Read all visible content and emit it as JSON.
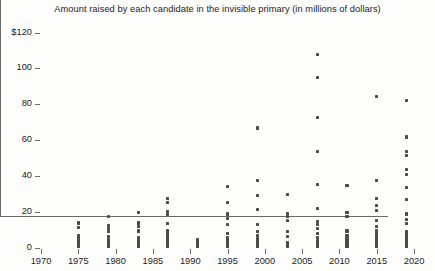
{
  "chart_data": {
    "type": "scatter",
    "title": "Amount raised by each candidate in the invisible primary (in millions of dollars)",
    "xlabel": "",
    "ylabel": "",
    "xlim": [
      1970,
      2022
    ],
    "ylim": [
      0,
      120
    ],
    "grid": false,
    "legend": null,
    "xticks": [
      1970,
      1975,
      1980,
      1985,
      1990,
      1995,
      2000,
      2005,
      2010,
      2015,
      2020
    ],
    "xtick_labels": [
      "1970",
      "1975",
      "1980",
      "1985",
      "1990",
      "1995",
      "2000",
      "2005",
      "2010",
      "2015",
      "2020"
    ],
    "yticks": [
      0,
      20,
      40,
      60,
      80,
      100,
      120
    ],
    "ytick_labels": [
      "0",
      "20",
      "40",
      "60",
      "80",
      "100",
      "$120"
    ],
    "marker": "square",
    "marker_color": "#4a4a4a",
    "series": [
      {
        "name": "candidates",
        "points": [
          [
            1975,
            1.0
          ],
          [
            1975,
            1.8
          ],
          [
            1975,
            2.6
          ],
          [
            1975,
            3.4
          ],
          [
            1975,
            4.2
          ],
          [
            1975,
            5.0
          ],
          [
            1975,
            6.0
          ],
          [
            1975,
            7.0
          ],
          [
            1975,
            11.5
          ],
          [
            1975,
            14.0
          ],
          [
            1979,
            0.8
          ],
          [
            1979,
            1.6
          ],
          [
            1979,
            2.4
          ],
          [
            1979,
            3.2
          ],
          [
            1979,
            4.0
          ],
          [
            1979,
            5.0
          ],
          [
            1979,
            6.2
          ],
          [
            1979,
            9.0
          ],
          [
            1979,
            11.0
          ],
          [
            1979,
            12.5
          ],
          [
            1979,
            17.5
          ],
          [
            1983,
            0.8
          ],
          [
            1983,
            1.6
          ],
          [
            1983,
            2.5
          ],
          [
            1983,
            3.5
          ],
          [
            1983,
            4.5
          ],
          [
            1983,
            6.0
          ],
          [
            1983,
            9.5
          ],
          [
            1983,
            12.0
          ],
          [
            1983,
            14.0
          ],
          [
            1983,
            20.0
          ],
          [
            1987,
            0.8
          ],
          [
            1987,
            1.6
          ],
          [
            1987,
            2.4
          ],
          [
            1987,
            3.2
          ],
          [
            1987,
            4.0
          ],
          [
            1987,
            5.0
          ],
          [
            1987,
            6.0
          ],
          [
            1987,
            7.0
          ],
          [
            1987,
            8.0
          ],
          [
            1987,
            9.0
          ],
          [
            1987,
            10.0
          ],
          [
            1987,
            13.5
          ],
          [
            1987,
            18.5
          ],
          [
            1987,
            20.5
          ],
          [
            1987,
            25.5
          ],
          [
            1987,
            27.5
          ],
          [
            1991,
            0.7
          ],
          [
            1991,
            1.4
          ],
          [
            1991,
            2.1
          ],
          [
            1991,
            3.0
          ],
          [
            1991,
            4.5
          ],
          [
            1995,
            0.8
          ],
          [
            1995,
            1.6
          ],
          [
            1995,
            2.6
          ],
          [
            1995,
            3.6
          ],
          [
            1995,
            4.6
          ],
          [
            1995,
            6.0
          ],
          [
            1995,
            8.0
          ],
          [
            1995,
            13.0
          ],
          [
            1995,
            16.5
          ],
          [
            1995,
            19.0
          ],
          [
            1995,
            25.5
          ],
          [
            1995,
            34.5
          ],
          [
            1999,
            0.8
          ],
          [
            1999,
            1.8
          ],
          [
            1999,
            3.0
          ],
          [
            1999,
            4.2
          ],
          [
            1999,
            5.4
          ],
          [
            1999,
            7.0
          ],
          [
            1999,
            9.0
          ],
          [
            1999,
            13.0
          ],
          [
            1999,
            21.5
          ],
          [
            1999,
            29.5
          ],
          [
            1999,
            37.5
          ],
          [
            1999,
            67.0
          ],
          [
            2003,
            0.8
          ],
          [
            2003,
            2.0
          ],
          [
            2003,
            3.2
          ],
          [
            2003,
            6.5
          ],
          [
            2003,
            9.0
          ],
          [
            2003,
            15.5
          ],
          [
            2003,
            17.5
          ],
          [
            2003,
            19.5
          ],
          [
            2003,
            30.0
          ],
          [
            2007,
            0.8
          ],
          [
            2007,
            1.8
          ],
          [
            2007,
            2.8
          ],
          [
            2007,
            4.0
          ],
          [
            2007,
            6.0
          ],
          [
            2007,
            8.0
          ],
          [
            2007,
            11.0
          ],
          [
            2007,
            13.0
          ],
          [
            2007,
            15.0
          ],
          [
            2007,
            22.0
          ],
          [
            2007,
            35.5
          ],
          [
            2007,
            54.0
          ],
          [
            2007,
            73.0
          ],
          [
            2007,
            95.0
          ],
          [
            2007,
            108.0
          ],
          [
            2011,
            0.8
          ],
          [
            2011,
            1.8
          ],
          [
            2011,
            2.8
          ],
          [
            2011,
            4.0
          ],
          [
            2011,
            5.2
          ],
          [
            2011,
            7.0
          ],
          [
            2011,
            9.5
          ],
          [
            2011,
            17.5
          ],
          [
            2011,
            20.0
          ],
          [
            2011,
            35.0
          ],
          [
            2015,
            0.8
          ],
          [
            2015,
            1.6
          ],
          [
            2015,
            2.4
          ],
          [
            2015,
            3.4
          ],
          [
            2015,
            4.4
          ],
          [
            2015,
            5.6
          ],
          [
            2015,
            7.0
          ],
          [
            2015,
            8.5
          ],
          [
            2015,
            10.0
          ],
          [
            2015,
            12.0
          ],
          [
            2015,
            15.5
          ],
          [
            2015,
            21.0
          ],
          [
            2015,
            24.0
          ],
          [
            2015,
            27.5
          ],
          [
            2015,
            37.5
          ],
          [
            2015,
            84.5
          ],
          [
            2019,
            0.8
          ],
          [
            2019,
            1.6
          ],
          [
            2019,
            2.4
          ],
          [
            2019,
            3.2
          ],
          [
            2019,
            4.0
          ],
          [
            2019,
            4.8
          ],
          [
            2019,
            5.6
          ],
          [
            2019,
            6.4
          ],
          [
            2019,
            7.2
          ],
          [
            2019,
            8.0
          ],
          [
            2019,
            9.0
          ],
          [
            2019,
            13.5
          ],
          [
            2019,
            16.0
          ],
          [
            2019,
            19.0
          ],
          [
            2019,
            27.0
          ],
          [
            2019,
            34.0
          ],
          [
            2019,
            41.0
          ],
          [
            2019,
            44.0
          ],
          [
            2019,
            51.5
          ],
          [
            2019,
            54.0
          ],
          [
            2019,
            62.0
          ],
          [
            2019,
            82.5
          ]
        ]
      }
    ]
  }
}
